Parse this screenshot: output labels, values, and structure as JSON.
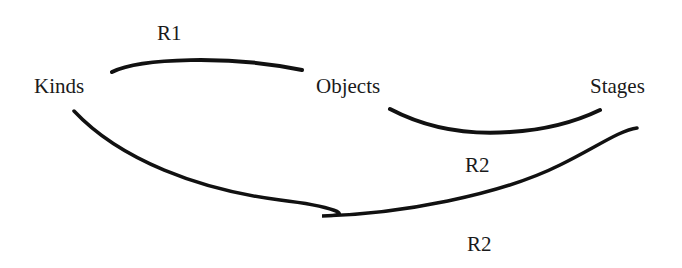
{
  "nodes": {
    "kinds": "Kinds",
    "objects": "Objects",
    "stages": "Stages"
  },
  "edges": {
    "kinds_objects": "R1",
    "objects_stages": "R2",
    "kinds_stages": "R2"
  },
  "colors": {
    "stroke": "#111111",
    "background": "#ffffff"
  }
}
